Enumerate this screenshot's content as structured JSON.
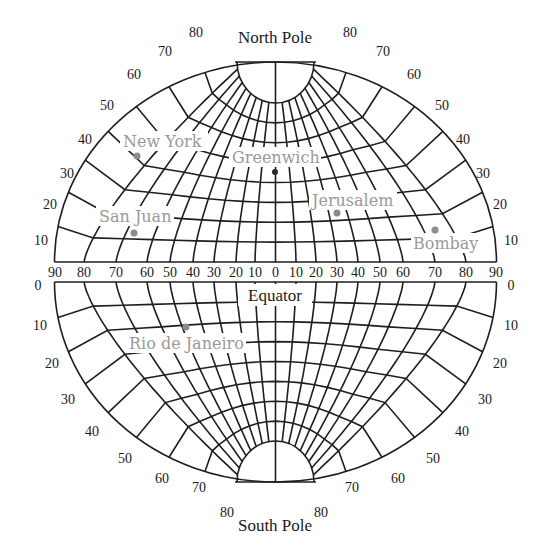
{
  "diagram": {
    "title_north": "North Pole",
    "title_south": "South Pole",
    "equator_label": "Equator",
    "longitude_ticks": [
      "90",
      "80",
      "70",
      "60",
      "50",
      "40",
      "30",
      "20",
      "10",
      "0",
      "10",
      "20",
      "30",
      "40",
      "50",
      "60",
      "70",
      "80",
      "90"
    ],
    "north_latitude_ticks_left": [
      "10",
      "20",
      "30",
      "40",
      "50",
      "60",
      "70",
      "80"
    ],
    "north_latitude_ticks_right": [
      "10",
      "20",
      "30",
      "40",
      "50",
      "60",
      "70",
      "80"
    ],
    "south_latitude_ticks_left": [
      "0",
      "10",
      "20",
      "30",
      "40",
      "50",
      "60",
      "70",
      "80"
    ],
    "south_latitude_ticks_right": [
      "0",
      "10",
      "20",
      "30",
      "40",
      "50",
      "60",
      "70",
      "80"
    ],
    "cities": [
      {
        "name": "New York",
        "lat": 41,
        "lon": -74,
        "hemisphere": "north"
      },
      {
        "name": "Greenwich",
        "lat": 51,
        "lon": 0,
        "hemisphere": "north"
      },
      {
        "name": "Jerusalem",
        "lat": 32,
        "lon": 35,
        "hemisphere": "north"
      },
      {
        "name": "San Juan",
        "lat": 18,
        "lon": -66,
        "hemisphere": "north"
      },
      {
        "name": "Bombay",
        "lat": 19,
        "lon": 73,
        "hemisphere": "north"
      },
      {
        "name": "Rio de Janeiro",
        "lat": -23,
        "lon": -43,
        "hemisphere": "south"
      }
    ],
    "colors": {
      "grid": "#1e1e1e",
      "city_label": "#9a9a9a",
      "city_dot": "#8c8c8c",
      "text": "#1a1a1a"
    }
  }
}
